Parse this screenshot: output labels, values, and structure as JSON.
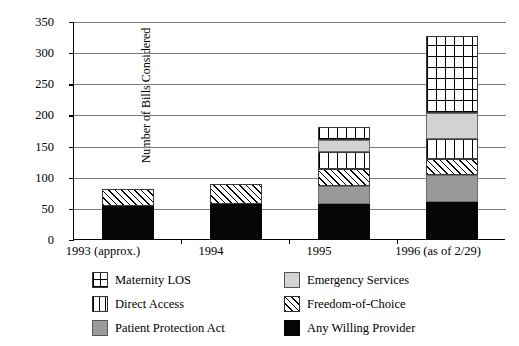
{
  "chart_data": {
    "type": "bar",
    "stacked": true,
    "title": "",
    "xlabel": "",
    "ylabel": "Number of Bills Considered",
    "ylim": [
      0,
      350
    ],
    "ytick_step": 50,
    "yticks": [
      "350",
      "300",
      "250",
      "200",
      "150",
      "100",
      "50",
      "0"
    ],
    "grid": true,
    "legend_position": "bottom",
    "categories": [
      "1993 (approx.)",
      "1994",
      "1995",
      "1996 (as of 2/29)"
    ],
    "series": [
      {
        "name": "Any Willing Provider",
        "pattern": "solid-black",
        "values": [
          53,
          56,
          56,
          60
        ]
      },
      {
        "name": "Patient Protection Act",
        "pattern": "solid-darkgray",
        "values": [
          0,
          0,
          29,
          42
        ]
      },
      {
        "name": "Freedom-of-Choice",
        "pattern": "diagonal-hatch",
        "values": [
          27,
          33,
          28,
          27
        ]
      },
      {
        "name": "Direct Access",
        "pattern": "vertical-lines",
        "values": [
          0,
          0,
          26,
          31
        ]
      },
      {
        "name": "Emergency Services",
        "pattern": "solid-lightgray",
        "values": [
          0,
          0,
          20,
          42
        ]
      },
      {
        "name": "Maternity LOS",
        "pattern": "grid-lines",
        "values": [
          0,
          0,
          21,
          124
        ]
      }
    ],
    "totals": [
      80,
      89,
      180,
      326
    ]
  },
  "legend": {
    "items": [
      {
        "label": "Maternity LOS",
        "swatch": "grid"
      },
      {
        "label": "Emergency Services",
        "swatch": "lgray"
      },
      {
        "label": "Direct Access",
        "swatch": "vstripe"
      },
      {
        "label": "Freedom-of-Choice",
        "swatch": "hatch"
      },
      {
        "label": "Patient Protection Act",
        "swatch": "dgray"
      },
      {
        "label": "Any Willing Provider",
        "swatch": "black"
      }
    ]
  }
}
